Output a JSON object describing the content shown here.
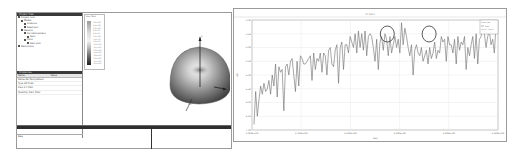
{
  "left_window": {
    "tree_panel": {
      "header": "Project Tree",
      "items": [
        {
          "label": "Project root",
          "indent": 0
        },
        {
          "label": "Model",
          "indent": 1
        },
        {
          "label": "Antenna",
          "indent": 2
        },
        {
          "label": "Feed port",
          "indent": 2
        },
        {
          "label": "Results",
          "indent": 1
        },
        {
          "label": "Far-field pattern",
          "indent": 2
        },
        {
          "label": "Gain",
          "indent": 3
        },
        {
          "label": "Plots",
          "indent": 2
        },
        {
          "label": "Rect plot",
          "indent": 3
        },
        {
          "label": "Definitions",
          "indent": 0
        }
      ]
    },
    "properties_panel": {
      "header": "Properties",
      "columns": [
        "Name",
        "Value"
      ],
      "rows": [
        "Name  Far-field pattern",
        "Type  3D Polar",
        "Freq  2.4 GHz",
        "Quantity  Gain Total"
      ],
      "footer": "Raw"
    },
    "colorbar": {
      "title": "Gain Total",
      "labels": [
        "2.0e+00",
        "1.6e+00",
        "1.2e+00",
        "8.0e-01",
        "4.0e-01",
        "0.0e+00",
        "-4.0e-01",
        "-8.0e-01",
        "-1.2e+00",
        "-1.6e+00",
        "-2.0e+00",
        "-2.4e+00",
        "-2.8e+00",
        "-3.2e+00",
        "-3.6e+00",
        "-4.0e+00"
      ]
    },
    "view3d": {
      "axes": {
        "z": "Z",
        "x": "X",
        "y": "Phi"
      }
    },
    "output_strip": {
      "header": "Messages"
    }
  },
  "right_window": {
    "colors": {
      "line": "#6b6b6b",
      "annotation": "#4a4a4a",
      "grid": "#e4e4e4"
    }
  },
  "chart_data": {
    "type": "line",
    "title": "XY Plot 1",
    "xlabel": "Freq",
    "ylabel": "dB",
    "x_ticks": [
      "2.000E+09",
      "2.100E+09",
      "2.200E+09",
      "2.300E+09",
      "2.400E+09",
      "2.500E+09"
    ],
    "y_ticks": [
      "-3.00",
      "-3.50",
      "-4.00",
      "-4.50",
      "-5.00",
      "-5.50",
      "-6.00",
      "-6.50",
      "-7.00"
    ],
    "ylim": [
      -7.0,
      -3.0
    ],
    "grid": true,
    "legend": {
      "position": "top-right",
      "entries": [
        "Curve Info",
        "Gain",
        "Setup1 : Sweep"
      ]
    },
    "annotations": [
      {
        "type": "circle",
        "x_frac": 0.55
      },
      {
        "type": "circle",
        "x_frac": 0.72
      }
    ],
    "series": [
      {
        "name": "Gain",
        "values": [
          -6.8,
          -5.6,
          -6.5,
          -5.9,
          -5.4,
          -5.7,
          -5.3,
          -5.6,
          -5.5,
          -5.2,
          -5.7,
          -5.0,
          -5.4,
          -4.6,
          -5.8,
          -4.7,
          -4.9,
          -4.8,
          -6.3,
          -4.7,
          -4.6,
          -5.0,
          -4.5,
          -4.4,
          -5.0,
          -5.6,
          -4.5,
          -5.4,
          -4.3,
          -4.4,
          -4.6,
          -4.6,
          -4.5,
          -4.4,
          -4.3,
          -5.2,
          -4.2,
          -4.8,
          -4.4,
          -4.5,
          -4.2,
          -4.9,
          -4.2,
          -4.3,
          -5.0,
          -4.1,
          -4.0,
          -4.6,
          -4.7,
          -4.1,
          -3.9,
          -5.3,
          -4.0,
          -3.8,
          -4.8,
          -3.9,
          -3.9,
          -4.2,
          -3.6,
          -3.8,
          -4.0,
          -3.5,
          -4.2,
          -3.4,
          -4.0,
          -3.5,
          -4.1,
          -3.4,
          -4.3,
          -3.6,
          -3.5,
          -3.6,
          -4.0,
          -4.5,
          -3.7,
          -4.8,
          -3.8,
          -3.6,
          -4.1,
          -3.5,
          -3.7,
          -4.3,
          -3.6,
          -4.2,
          -3.9,
          -3.6,
          -4.0,
          -3.7,
          -4.2,
          -3.1,
          -3.9,
          -3.3,
          -3.6,
          -4.0,
          -4.3,
          -3.9,
          -5.0,
          -4.1,
          -3.9,
          -4.2,
          -4.3,
          -4.0,
          -4.5,
          -4.3,
          -4.1,
          -4.6,
          -4.0,
          -4.4,
          -4.2,
          -3.8,
          -4.4,
          -4.1,
          -4.2,
          -3.6,
          -3.8,
          -3.7,
          -4.5,
          -3.6,
          -3.9,
          -3.9,
          -4.2,
          -3.7,
          -4.6,
          -3.6,
          -4.1,
          -3.8,
          -3.9,
          -3.6,
          -4.8,
          -4.0,
          -4.3,
          -3.9,
          -3.6,
          -4.4,
          -3.5,
          -4.6,
          -3.7,
          -3.6,
          -3.3,
          -3.5,
          -4.0,
          -3.6,
          -3.4,
          -3.9,
          -3.7,
          -4.2,
          -3.2
        ]
      }
    ]
  }
}
